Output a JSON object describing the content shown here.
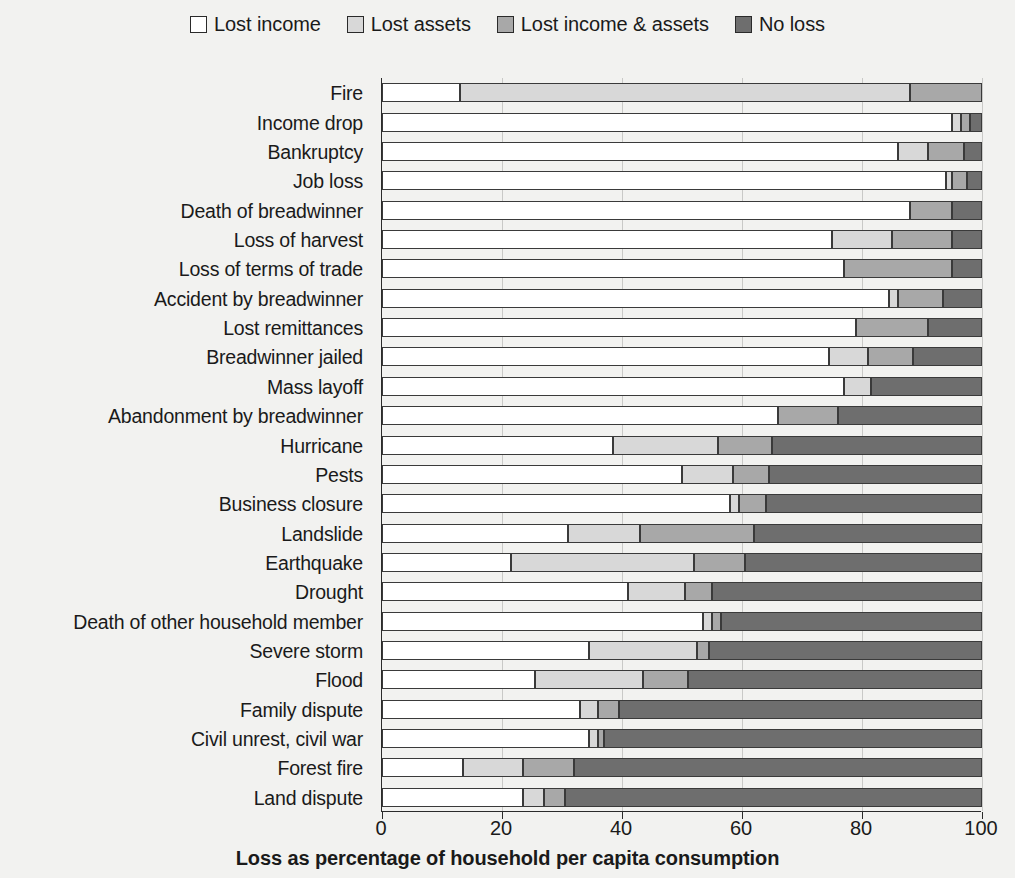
{
  "chart_data": {
    "type": "bar",
    "orientation": "horizontal",
    "stacked": true,
    "title": "",
    "xlabel": "Loss as percentage of household per capita consumption",
    "ylabel": "",
    "xlim": [
      0,
      100
    ],
    "xticks": [
      0,
      20,
      40,
      60,
      80,
      100
    ],
    "grid": true,
    "legend_position": "top",
    "categories": [
      "Fire",
      "Income drop",
      "Bankruptcy",
      "Job loss",
      "Death of breadwinner",
      "Loss of harvest",
      "Loss of terms of trade",
      "Accident by breadwinner",
      "Lost remittances",
      "Breadwinner jailed",
      "Mass layoff",
      "Abandonment by breadwinner",
      "Hurricane",
      "Pests",
      "Business closure",
      "Landslide",
      "Earthquake",
      "Drought",
      "Death of other household member",
      "Severe storm",
      "Flood",
      "Family dispute",
      "Civil unrest, civil war",
      "Forest fire",
      "Land dispute"
    ],
    "series": [
      {
        "name": "Lost income",
        "color": "#ffffff",
        "values": [
          13,
          95,
          86,
          94,
          88,
          75,
          77,
          84.5,
          79,
          74.5,
          77,
          66,
          38.5,
          50,
          58,
          31,
          21.5,
          41,
          53.5,
          34.5,
          25.5,
          33,
          34.5,
          13.5,
          23.5
        ]
      },
      {
        "name": "Lost assets",
        "color": "#d8d8d8",
        "values": [
          75,
          1.5,
          5,
          1,
          0,
          10,
          0,
          1.5,
          0,
          6.5,
          4.5,
          0,
          17.5,
          8.5,
          1.5,
          12,
          30.5,
          9.5,
          1.5,
          18,
          18,
          3,
          1.5,
          10,
          3.5
        ]
      },
      {
        "name": "Lost income & assets",
        "color": "#a8a8a8",
        "values": [
          12,
          1.5,
          6,
          2.5,
          7,
          10,
          18,
          7.5,
          12,
          7.5,
          0,
          10,
          9,
          6,
          4.5,
          19,
          8.5,
          4.5,
          1.5,
          2,
          7.5,
          3.5,
          1,
          8.5,
          3.5
        ]
      },
      {
        "name": "No loss",
        "color": "#6e6e6e",
        "values": [
          0,
          2,
          3,
          2.5,
          5,
          5,
          5,
          6.5,
          9,
          11.5,
          18.5,
          24,
          35,
          35.5,
          36,
          38,
          39.5,
          45,
          43.5,
          45.5,
          49,
          60.5,
          63,
          68,
          69.5
        ]
      }
    ]
  },
  "legend": {
    "items": [
      {
        "label": "Lost income",
        "color": "#ffffff"
      },
      {
        "label": "Lost assets",
        "color": "#d8d8d8"
      },
      {
        "label": "Lost income & assets",
        "color": "#a8a8a8"
      },
      {
        "label": "No loss",
        "color": "#6e6e6e"
      }
    ]
  },
  "axis": {
    "x_title": "Loss as percentage of household per capita consumption",
    "x_tick_labels": [
      "0",
      "20",
      "40",
      "60",
      "80",
      "100"
    ]
  }
}
